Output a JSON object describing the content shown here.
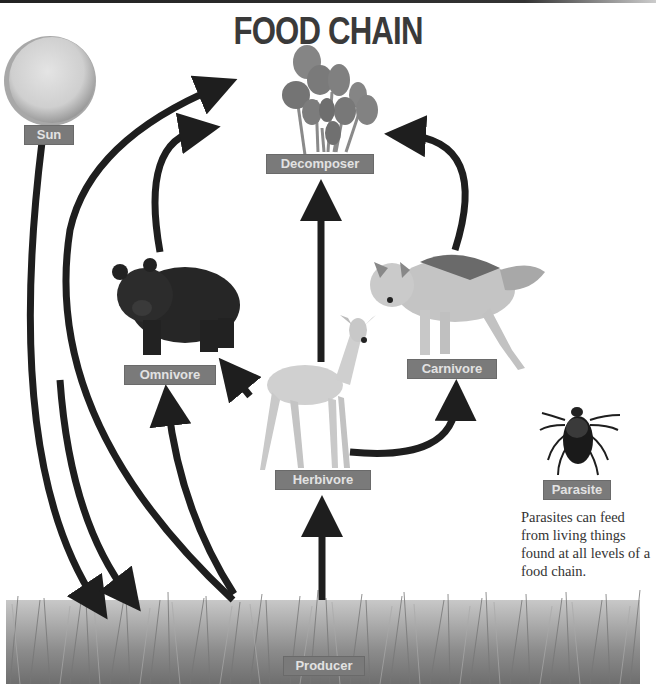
{
  "title": "FOOD CHAIN",
  "nodes": {
    "sun": {
      "label": "Sun",
      "icon": "sun-icon"
    },
    "decomposer": {
      "label": "Decomposer",
      "icon": "mushroom-icon"
    },
    "omnivore": {
      "label": "Omnivore",
      "icon": "bear-icon"
    },
    "carnivore": {
      "label": "Carnivore",
      "icon": "wolf-icon"
    },
    "herbivore": {
      "label": "Herbivore",
      "icon": "deer-icon"
    },
    "parasite": {
      "label": "Parasite",
      "icon": "tick-icon"
    },
    "producer": {
      "label": "Producer",
      "icon": "grass-icon"
    }
  },
  "parasite_note": "Parasites can feed from living things found at all levels of a food chain.",
  "colors": {
    "label_bg": "#7a7a7a",
    "label_text": "#e2e2e2",
    "arrow": "#1e1e1e",
    "title": "#3a3a3a"
  },
  "edges": [
    {
      "from": "sun",
      "to": "producer"
    },
    {
      "from": "producer",
      "to": "decomposer"
    },
    {
      "from": "producer",
      "to": "omnivore"
    },
    {
      "from": "producer",
      "to": "herbivore"
    },
    {
      "from": "omnivore",
      "to": "decomposer"
    },
    {
      "from": "herbivore",
      "to": "omnivore"
    },
    {
      "from": "herbivore",
      "to": "decomposer"
    },
    {
      "from": "herbivore",
      "to": "carnivore"
    },
    {
      "from": "carnivore",
      "to": "decomposer"
    }
  ]
}
